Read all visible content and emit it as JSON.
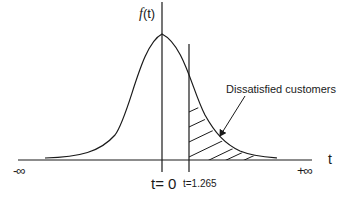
{
  "diagram": {
    "type": "normal-distribution-curve",
    "y_axis_label_func": "f",
    "y_axis_label_arg": "(t)",
    "x_axis_label": "t",
    "x_min_label": "-∞",
    "x_max_label": "+∞",
    "center_label": "t= 0",
    "threshold_label": "t=1.265",
    "shaded_region_label": "Dissatisfied customers",
    "shaded_region": "right tail beyond t=1.265 (hatched)",
    "colors": {
      "line": "#1a1a1a",
      "background": "#ffffff"
    }
  }
}
